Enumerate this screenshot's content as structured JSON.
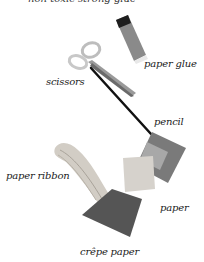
{
  "caption_top_partial": "non-toxic strong glue",
  "labels": {
    "paper_glue": "paper glue",
    "scissors": "scissors",
    "pencil": "pencil",
    "paper_ribbon": "paper ribbon",
    "paper": "paper",
    "crepe_paper": "crêpe paper"
  },
  "colors": {
    "background": "#ffffff",
    "text": "#1a1a1a",
    "glue_body": "#8a8a8a",
    "glue_cap": "#1e1e1e",
    "pencil": "#111111",
    "paper_dark": "#6e6e6e",
    "paper_light": "#cfcfcf",
    "crepe_paper": "#555555",
    "ribbon": "#c9c4bc"
  }
}
